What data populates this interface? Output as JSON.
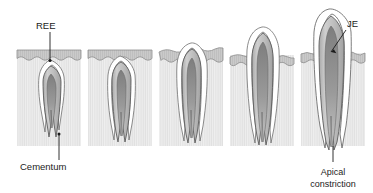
{
  "figure": {
    "panel_count": 5,
    "labels": {
      "ree": "REE",
      "cementum": "Cementum",
      "je": "JE",
      "apical_line1": "Apical",
      "apical_line2": "constriction"
    },
    "colors": {
      "background": "#ffffff",
      "bone_fill": "#ededed",
      "bone_hatch": "#e0e0e0",
      "gingiva_fill": "#c9c9c9",
      "gingiva_stroke": "#8a8a8a",
      "enamel_fill": "#ffffff",
      "dentin_fill": "#bdbdbd",
      "pulp_fill": "#8f8f8f",
      "outline": "#555555",
      "label_text": "#1b1b1b"
    },
    "panels": [
      {
        "index": 1,
        "name": "stage-1-early-eruption",
        "stage": "Crown still submerged, REE covering enamel",
        "bone_box": {
          "x": 17,
          "y": 50,
          "w": 64,
          "h": 96
        },
        "gingiva_band": {
          "x": 17,
          "y": 50,
          "w": 64,
          "h": 12
        },
        "crown_tip_y": 60,
        "root_tip_y": 140
      },
      {
        "index": 2,
        "name": "stage-2-crown-approaching-surface",
        "stage": "Crown rising toward the oral surface",
        "bone_box": {
          "x": 88,
          "y": 50,
          "w": 64,
          "h": 96
        },
        "gingiva_band": {
          "x": 88,
          "y": 50,
          "w": 64,
          "h": 12
        },
        "crown_tip_y": 56,
        "root_tip_y": 140
      },
      {
        "index": 3,
        "name": "stage-3-emerging-crown",
        "stage": "Crown tip penetrating the gingiva",
        "bone_box": {
          "x": 159,
          "y": 52,
          "w": 64,
          "h": 94
        },
        "gingiva_band": {
          "x": 159,
          "y": 52,
          "w": 64,
          "h": 12
        },
        "crown_tip_y": 42,
        "root_tip_y": 140
      },
      {
        "index": 4,
        "name": "stage-4-partially-erupted",
        "stage": "Crown partly erupted above gingival margin",
        "bone_box": {
          "x": 230,
          "y": 55,
          "w": 64,
          "h": 91
        },
        "gingiva_band": {
          "x": 230,
          "y": 55,
          "w": 64,
          "h": 12
        },
        "crown_tip_y": 26,
        "root_tip_y": 142
      },
      {
        "index": 5,
        "name": "stage-5-fully-erupted",
        "stage": "Fully erupted tooth with junctional epithelium",
        "bone_box": {
          "x": 301,
          "y": 53,
          "w": 64,
          "h": 93
        },
        "gingiva_band": {
          "x": 301,
          "y": 53,
          "w": 64,
          "h": 12
        },
        "crown_tip_y": 10,
        "root_tip_y": 148
      }
    ],
    "annotations": [
      {
        "name": "ree-annotation",
        "label": "REE",
        "text_x": 36,
        "text_y": 29,
        "leader_from": [
          50,
          32
        ],
        "leader_to": [
          50,
          61
        ],
        "marker": [
          50,
          61
        ]
      },
      {
        "name": "cementum-annotation",
        "label": "Cementum",
        "text_x": 22,
        "text_y": 168,
        "leader_from": [
          59,
          158
        ],
        "leader_to": [
          59,
          136
        ],
        "marker": [
          59,
          136
        ]
      },
      {
        "name": "je-annotation",
        "label": "JE",
        "text_x": 348,
        "text_y": 26,
        "leader_from": [
          346,
          29
        ],
        "leader_to": [
          330,
          52
        ],
        "marker": [
          330,
          52
        ]
      },
      {
        "name": "apical-constriction-annotation",
        "label": "Apical constriction",
        "text_x": 333,
        "text_y": 174,
        "leader_from": [
          333,
          160
        ],
        "leader_to": [
          333,
          146
        ],
        "marker": [
          333,
          146
        ]
      }
    ]
  }
}
